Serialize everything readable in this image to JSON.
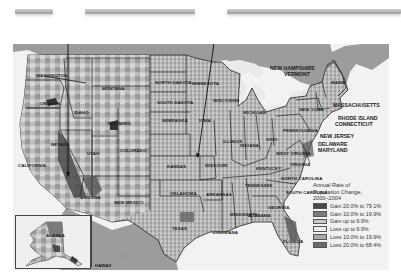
{
  "callout_bars": [
    {
      "id": "bar-1",
      "x": 15,
      "y": 9,
      "w": 38
    },
    {
      "id": "bar-2",
      "x": 85,
      "y": 9,
      "w": 110
    },
    {
      "id": "bar-3",
      "x": 227,
      "y": 9,
      "w": 174
    }
  ],
  "map": {
    "title": "Annual Rate of Population Change, 2000–2004",
    "state_labels": [
      {
        "name": "WASHINGTON",
        "x": 36,
        "y": 73
      },
      {
        "name": "OREGON",
        "x": 40,
        "y": 101
      },
      {
        "name": "IDAHO",
        "x": 74,
        "y": 110
      },
      {
        "name": "MONTANA",
        "x": 102,
        "y": 86
      },
      {
        "name": "WYOMING",
        "x": 108,
        "y": 121
      },
      {
        "name": "NORTH DAKOTA",
        "x": 155,
        "y": 80
      },
      {
        "name": "SOUTH DAKOTA",
        "x": 157,
        "y": 100
      },
      {
        "name": "MINNESOTA",
        "x": 192,
        "y": 81
      },
      {
        "name": "WISCONSIN",
        "x": 213,
        "y": 98
      },
      {
        "name": "MICHIGAN",
        "x": 243,
        "y": 110
      },
      {
        "name": "NEBRASKA",
        "x": 162,
        "y": 118
      },
      {
        "name": "IOWA",
        "x": 199,
        "y": 118
      },
      {
        "name": "NEVADA",
        "x": 51,
        "y": 142
      },
      {
        "name": "UTAH",
        "x": 87,
        "y": 151
      },
      {
        "name": "COLORADO",
        "x": 120,
        "y": 148
      },
      {
        "name": "CALIFORNIA",
        "x": 18,
        "y": 163
      },
      {
        "name": "KANSAS",
        "x": 167,
        "y": 164
      },
      {
        "name": "MISSOURI",
        "x": 205,
        "y": 163
      },
      {
        "name": "ILLINOIS",
        "x": 223,
        "y": 139
      },
      {
        "name": "INDIANA",
        "x": 240,
        "y": 143
      },
      {
        "name": "OHIO",
        "x": 266,
        "y": 137
      },
      {
        "name": "KENTUCKY",
        "x": 256,
        "y": 166
      },
      {
        "name": "ARIZONA",
        "x": 80,
        "y": 195
      },
      {
        "name": "NEW MEXICO",
        "x": 114,
        "y": 200
      },
      {
        "name": "OKLAHOMA",
        "x": 170,
        "y": 191
      },
      {
        "name": "ARKANSAS",
        "x": 206,
        "y": 192
      },
      {
        "name": "TENNESSEE",
        "x": 245,
        "y": 183
      },
      {
        "name": "NORTH CAROLINA",
        "x": 281,
        "y": 176
      },
      {
        "name": "SOUTH CAROLINA",
        "x": 286,
        "y": 190
      },
      {
        "name": "GEORGIA",
        "x": 268,
        "y": 205
      },
      {
        "name": "ALABAMA",
        "x": 248,
        "y": 213
      },
      {
        "name": "MISSISSIPPI",
        "x": 230,
        "y": 212
      },
      {
        "name": "LOUISIANA",
        "x": 213,
        "y": 230
      },
      {
        "name": "TEXAS",
        "x": 172,
        "y": 226
      },
      {
        "name": "FLORIDA",
        "x": 283,
        "y": 239
      },
      {
        "name": "VIRGINIA",
        "x": 290,
        "y": 162
      },
      {
        "name": "WEST VIRGINIA",
        "x": 276,
        "y": 151
      },
      {
        "name": "PENNSYLVANIA",
        "x": 283,
        "y": 128
      },
      {
        "name": "NEW YORK",
        "x": 299,
        "y": 107
      },
      {
        "name": "MAINE",
        "x": 331,
        "y": 80
      }
    ],
    "northeast_labels": [
      {
        "name": "NEW HAMPSHIRE",
        "x": 270,
        "y": 65
      },
      {
        "name": "VERMONT",
        "x": 284,
        "y": 71
      },
      {
        "name": "MASSACHUSETTS",
        "x": 333,
        "y": 102
      },
      {
        "name": "RHODE ISLAND",
        "x": 338,
        "y": 115
      },
      {
        "name": "CONNECTICUT",
        "x": 335,
        "y": 121
      },
      {
        "name": "NEW JERSEY",
        "x": 320,
        "y": 133
      },
      {
        "name": "DELAWARE",
        "x": 318,
        "y": 141
      },
      {
        "name": "MARYLAND",
        "x": 318,
        "y": 147
      }
    ],
    "insets": [
      {
        "name": "ALASKA",
        "label_x": 48,
        "label_y": 237
      },
      {
        "name": "HAWAII",
        "label_x": 95,
        "label_y": 265
      }
    ]
  },
  "legend": {
    "title_line1": "Annual Rate of",
    "title_line2": "Population Change,",
    "title_line3": "2000–2004",
    "items": [
      {
        "label": "Gain 20.0% to 79.1%",
        "color": "#4a4a4a"
      },
      {
        "label": "Gain 10.0% to 19.9%",
        "color": "#7d7d7d"
      },
      {
        "label": "Gain up to 9.9%",
        "color": "#c9c9c9"
      },
      {
        "label": "Loss up to 9.9%",
        "color": "#eeeeee"
      },
      {
        "label": "Loss 10.0% to 19.9%",
        "color": "#a9a9a9"
      },
      {
        "label": "Loss 20.0% to 68.4%",
        "color": "#6a6a6a"
      }
    ]
  },
  "colors": {
    "canada_mexico": "#9c9c9c",
    "water": "#f2f2f2",
    "state_border": "#222222",
    "callout_line": "#111111"
  }
}
